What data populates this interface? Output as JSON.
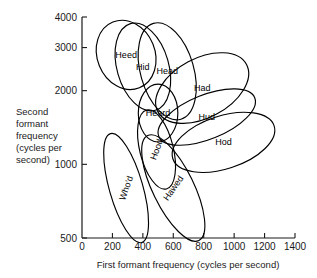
{
  "chart_data": {
    "type": "scatter",
    "title": "",
    "xlabel": "First formant frequency (cycles per second)",
    "ylabel": "Second formant frequency (cycles per second)",
    "ylabel_lines": [
      "Second",
      "formant",
      "frequency",
      "(cycles per",
      "second)"
    ],
    "xlim": [
      0,
      1400
    ],
    "ylim": [
      500,
      4000
    ],
    "yscale": "log",
    "grid": false,
    "legend": "none",
    "xticks": [
      0,
      200,
      400,
      600,
      800,
      1000,
      1200,
      1400
    ],
    "xtick_labels": [
      "0",
      "200",
      "400",
      "600",
      "800",
      "1000",
      "1200",
      "1400"
    ],
    "yticks": [
      500,
      1000,
      2000,
      3000,
      4000
    ],
    "ytick_labels": [
      "500",
      "1000",
      "2000",
      "3000",
      "4000"
    ],
    "annotation_note": "Peterson-Barney style vowel ellipses: each outlined ellipse encloses the region of first/second formant frequency pairs for one English vowel, labelled by a key word.",
    "series": [
      {
        "name": "Heed",
        "label": "Heed",
        "cx": 290,
        "cy": 2800,
        "rx": 190,
        "ry": 900,
        "rotation_deg": -22,
        "label_rotation_deg": 0
      },
      {
        "name": "Hid",
        "label": "Hid",
        "cx": 400,
        "cy": 2500,
        "rx": 170,
        "ry": 1000,
        "rotation_deg": -16,
        "label_rotation_deg": 0
      },
      {
        "name": "Head",
        "label": "Head",
        "cx": 560,
        "cy": 2400,
        "rx": 175,
        "ry": 1050,
        "rotation_deg": -16,
        "label_rotation_deg": 0
      },
      {
        "name": "Had",
        "label": "Had",
        "cx": 790,
        "cy": 2050,
        "rx": 330,
        "ry": 560,
        "rotation_deg": -28,
        "label_rotation_deg": 0
      },
      {
        "name": "Heard",
        "label": "Heard",
        "cx": 500,
        "cy": 1620,
        "rx": 130,
        "ry": 430,
        "rotation_deg": 0,
        "label_rotation_deg": 0
      },
      {
        "name": "Hud",
        "label": "Hud",
        "cx": 820,
        "cy": 1560,
        "rx": 340,
        "ry": 320,
        "rotation_deg": -22,
        "label_rotation_deg": 0
      },
      {
        "name": "Hod",
        "label": "Hod",
        "cx": 930,
        "cy": 1230,
        "rx": 350,
        "ry": 300,
        "rotation_deg": -18,
        "label_rotation_deg": 0
      },
      {
        "name": "Hood",
        "label": "Hood",
        "cx": 490,
        "cy": 1150,
        "rx": 110,
        "ry": 420,
        "rotation_deg": -14,
        "label_rotation_deg": -70
      },
      {
        "name": "Who'd",
        "label": "Who'd",
        "cx": 290,
        "cy": 800,
        "rx": 110,
        "ry": 390,
        "rotation_deg": -16,
        "label_rotation_deg": -70
      },
      {
        "name": "Hawed",
        "label": "Hawed",
        "cx": 600,
        "cy": 800,
        "rx": 135,
        "ry": 400,
        "rotation_deg": -26,
        "label_rotation_deg": -55
      }
    ]
  },
  "plot": {
    "area_left": 82,
    "area_top": 17,
    "area_right": 295,
    "area_bottom": 238
  }
}
